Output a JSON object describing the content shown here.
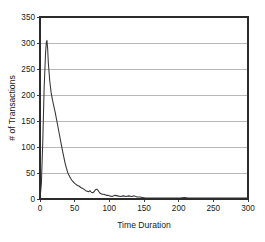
{
  "chart_data": {
    "type": "line",
    "title": "",
    "xlabel": "Time Duration",
    "ylabel": "# of Transactions",
    "xlim": [
      0,
      300
    ],
    "ylim": [
      0,
      350
    ],
    "xticks": [
      0,
      50,
      100,
      150,
      200,
      250,
      300
    ],
    "yticks": [
      0,
      50,
      100,
      150,
      200,
      250,
      300,
      350
    ],
    "xtick_labels": [
      "0",
      "50",
      "100",
      "150",
      "200",
      "250",
      "300"
    ],
    "ytick_labels": [
      "0",
      "50",
      "100",
      "150",
      "200",
      "250",
      "300",
      "350"
    ],
    "grid": "horizontal",
    "legend": "none",
    "line_color": "#343434",
    "grid_color": "#9a9a9a",
    "frame_color": "#2b2b2b",
    "background_color": "#ffffff",
    "series": [
      {
        "name": "# of Transactions",
        "x": [
          0,
          2,
          4,
          6,
          8,
          9,
          10,
          11,
          12,
          14,
          16,
          18,
          20,
          22,
          24,
          26,
          28,
          30,
          32,
          34,
          36,
          38,
          40,
          42,
          44,
          46,
          48,
          50,
          52,
          54,
          56,
          58,
          60,
          62,
          64,
          66,
          68,
          70,
          72,
          74,
          76,
          78,
          80,
          82,
          84,
          86,
          88,
          90,
          92,
          94,
          96,
          98,
          100,
          104,
          108,
          112,
          116,
          120,
          124,
          128,
          132,
          136,
          140,
          144,
          148,
          152,
          156,
          160,
          166,
          172,
          178,
          184,
          190,
          196,
          202,
          208,
          214,
          220,
          228,
          236,
          244,
          252,
          260,
          268,
          276,
          284,
          292,
          300
        ],
        "y": [
          0,
          30,
          110,
          215,
          280,
          300,
          305,
          290,
          262,
          228,
          205,
          190,
          178,
          166,
          152,
          138,
          124,
          110,
          96,
          83,
          70,
          60,
          51,
          45,
          40,
          36,
          33,
          30,
          28,
          26,
          25,
          23,
          21,
          20,
          18,
          16,
          15,
          14,
          16,
          13,
          12,
          14,
          18,
          19,
          16,
          12,
          10,
          9,
          9,
          8,
          7,
          7,
          6,
          5,
          7,
          6,
          5,
          6,
          5,
          6,
          5,
          6,
          4,
          4,
          3,
          2,
          2,
          2,
          2,
          2,
          2,
          2,
          2,
          2,
          2,
          3,
          2,
          2,
          2,
          2,
          2,
          2,
          2,
          2,
          2,
          2,
          2,
          2
        ],
        "peak_x": 10,
        "peak_y": 305
      }
    ]
  }
}
